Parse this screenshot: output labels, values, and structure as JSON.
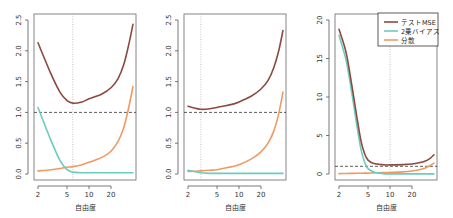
{
  "colors": {
    "test_mse": "#8B4A3E",
    "bias_sq": "#6CCBC0",
    "variance": "#F09A62",
    "reference_line": "#333333",
    "optimum_line": "#AAAAAA"
  },
  "legend": {
    "entries": [
      {
        "label": "テストMSE",
        "key": "test_mse"
      },
      {
        "label": "2乗バイアス",
        "key": "bias_sq"
      },
      {
        "label": "分散",
        "key": "variance"
      }
    ]
  },
  "chart_data": [
    {
      "type": "line",
      "title": "",
      "xlabel": "自由度",
      "ylabel": "",
      "xscale": "log",
      "xlim": [
        2,
        40
      ],
      "ylim": [
        0,
        2.5
      ],
      "xticks": [
        2,
        5,
        10,
        20
      ],
      "xtick_labels": [
        "2",
        "5",
        "10",
        "20"
      ],
      "yticks": [
        0.0,
        0.5,
        1.0,
        1.5,
        2.0,
        2.5
      ],
      "ytick_labels": [
        "0.0",
        "0.5",
        "1.0",
        "1.5",
        "2.0",
        "2.5"
      ],
      "hline": {
        "y": 1.0,
        "style": "dashed"
      },
      "vline": {
        "x": 6,
        "style": "dotted"
      },
      "x": [
        2,
        3,
        4,
        5,
        6,
        8,
        10,
        15,
        20,
        25,
        30,
        35,
        40
      ],
      "series": [
        {
          "name": "テストMSE",
          "key": "test_mse",
          "values": [
            2.13,
            1.63,
            1.33,
            1.19,
            1.15,
            1.17,
            1.22,
            1.3,
            1.4,
            1.55,
            1.78,
            2.1,
            2.43
          ]
        },
        {
          "name": "2乗バイアス",
          "key": "bias_sq",
          "values": [
            1.08,
            0.55,
            0.22,
            0.07,
            0.03,
            0.02,
            0.02,
            0.02,
            0.02,
            0.02,
            0.02,
            0.02,
            0.02
          ]
        },
        {
          "name": "分散",
          "key": "variance",
          "values": [
            0.05,
            0.07,
            0.09,
            0.11,
            0.12,
            0.15,
            0.19,
            0.27,
            0.37,
            0.53,
            0.76,
            1.08,
            1.42
          ]
        }
      ],
      "legend": false
    },
    {
      "type": "line",
      "title": "",
      "xlabel": "自由度",
      "ylabel": "",
      "xscale": "log",
      "xlim": [
        2,
        40
      ],
      "ylim": [
        0,
        2.5
      ],
      "xticks": [
        2,
        5,
        10,
        20
      ],
      "xtick_labels": [
        "2",
        "5",
        "10",
        "20"
      ],
      "yticks": [
        0.0,
        0.5,
        1.0,
        1.5,
        2.0,
        2.5
      ],
      "ytick_labels": [
        "0.0",
        "0.5",
        "1.0",
        "1.5",
        "2.0",
        "2.5"
      ],
      "hline": {
        "y": 1.0,
        "style": "dashed"
      },
      "vline": {
        "x": 3,
        "style": "dotted"
      },
      "x": [
        2,
        3,
        4,
        5,
        6,
        8,
        10,
        15,
        20,
        25,
        30,
        35,
        40
      ],
      "series": [
        {
          "name": "テストMSE",
          "key": "test_mse",
          "values": [
            1.1,
            1.05,
            1.06,
            1.08,
            1.1,
            1.13,
            1.17,
            1.27,
            1.38,
            1.52,
            1.73,
            2.0,
            2.33
          ]
        },
        {
          "name": "2乗バイアス",
          "key": "bias_sq",
          "values": [
            0.06,
            0.02,
            0.01,
            0.01,
            0.01,
            0.01,
            0.01,
            0.01,
            0.01,
            0.01,
            0.01,
            0.01,
            0.01
          ]
        },
        {
          "name": "分散",
          "key": "variance",
          "values": [
            0.04,
            0.05,
            0.06,
            0.07,
            0.09,
            0.12,
            0.15,
            0.25,
            0.36,
            0.5,
            0.7,
            0.98,
            1.33
          ]
        }
      ],
      "legend": false
    },
    {
      "type": "line",
      "title": "",
      "xlabel": "自由度",
      "ylabel": "",
      "xscale": "log",
      "xlim": [
        2,
        40
      ],
      "ylim": [
        0,
        20
      ],
      "xticks": [
        2,
        5,
        10,
        20
      ],
      "xtick_labels": [
        "2",
        "5",
        "10",
        "20"
      ],
      "yticks": [
        0,
        5,
        10,
        15,
        20
      ],
      "ytick_labels": [
        "0",
        "5",
        "10",
        "15",
        "20"
      ],
      "hline": {
        "y": 1.0,
        "style": "dashed"
      },
      "vline": {
        "x": 10,
        "style": "dotted"
      },
      "x": [
        2,
        2.5,
        3,
        3.5,
        4,
        4.5,
        5,
        6,
        8,
        10,
        15,
        20,
        25,
        30,
        35,
        40
      ],
      "series": [
        {
          "name": "テストMSE",
          "key": "test_mse",
          "values": [
            18.8,
            15.8,
            11.5,
            7.5,
            4.3,
            2.6,
            1.8,
            1.35,
            1.2,
            1.18,
            1.22,
            1.3,
            1.45,
            1.65,
            2.0,
            2.5
          ]
        },
        {
          "name": "2乗バイアス",
          "key": "bias_sq",
          "values": [
            18.0,
            14.8,
            10.5,
            6.4,
            3.2,
            1.5,
            0.7,
            0.25,
            0.05,
            0.02,
            0.01,
            0.01,
            0.01,
            0.01,
            0.01,
            0.01
          ]
        },
        {
          "name": "分散",
          "key": "variance",
          "values": [
            0.05,
            0.07,
            0.08,
            0.09,
            0.1,
            0.11,
            0.12,
            0.15,
            0.18,
            0.2,
            0.27,
            0.38,
            0.55,
            0.76,
            1.08,
            1.42
          ]
        }
      ],
      "legend": true,
      "legend_position": "top-right"
    }
  ]
}
